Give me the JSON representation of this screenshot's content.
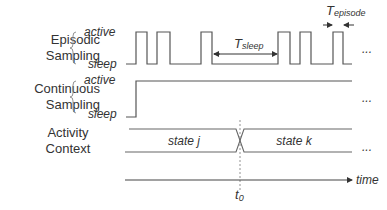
{
  "rows": {
    "episodic": {
      "label_line1": "Episodic",
      "label_line2": "Sampling",
      "level_high": "active",
      "level_low": "sleep"
    },
    "continuous": {
      "label_line1": "Continuous",
      "label_line2": "Sampling",
      "level_high": "active",
      "level_low": "sleep"
    },
    "activity": {
      "label_line1": "Activity",
      "label_line2": "Context",
      "state_before": "state j",
      "state_after": "state k"
    }
  },
  "annotations": {
    "t_sleep_main": "T",
    "t_sleep_sub": "sleep",
    "t_episode_main": "T",
    "t_episode_sub": "episode",
    "transition_main": "t",
    "transition_sub": "0",
    "axis_label": "time",
    "continuation": "..."
  },
  "signals": {
    "episodic_pulses_x": [
      [
        136,
        147
      ],
      [
        157,
        170
      ],
      [
        201,
        212
      ],
      [
        278,
        290
      ],
      [
        300,
        311
      ],
      [
        333,
        343
      ]
    ],
    "episodic_start_x": 126,
    "episodic_end_x": 352,
    "continuous_rise_x": 136,
    "transition_x": 240
  },
  "colors": {
    "line": "#555555",
    "text": "#333333",
    "dashed": "#777777"
  }
}
